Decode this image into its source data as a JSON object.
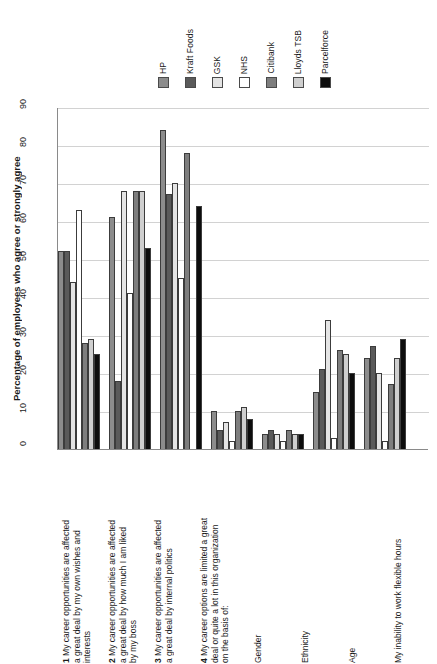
{
  "chart_data": {
    "type": "bar",
    "title": "",
    "subtitle": "",
    "xlabel": "",
    "ylabel": "Percentage of employees who agree or strongly agree",
    "ylim": [
      0,
      90
    ],
    "yticks": [
      0,
      10,
      20,
      30,
      40,
      50,
      60,
      70,
      80,
      90
    ],
    "grid": true,
    "legend_position": "top",
    "orientation": "vertical",
    "categories": [
      "1 My career opportunities are affected a great deal by my own wishes and interests",
      "2 My career opportunities are affected a great deal by how much I am liked by my boss",
      "3 My career opportunities are affected a great deal by internal politics",
      "Gender",
      "Ethnicity",
      "Age",
      "My inability to work flexible hours"
    ],
    "series": [
      {
        "name": "HP",
        "color": "#8c8c8c",
        "values": [
          52,
          61,
          84,
          10,
          4,
          15,
          24
        ]
      },
      {
        "name": "Kraft Foods",
        "color": "#5a5a5a",
        "values": [
          52,
          18,
          67,
          5,
          5,
          21,
          27
        ]
      },
      {
        "name": "GSK",
        "color": "#e4e4e4",
        "values": [
          44,
          68,
          70,
          7,
          4,
          34,
          20
        ]
      },
      {
        "name": "NHS",
        "color": "#ffffff",
        "values": [
          63,
          41,
          45,
          2,
          2,
          3,
          2
        ]
      },
      {
        "name": "Citibank",
        "color": "#7e7e7e",
        "values": [
          28,
          68,
          78,
          10,
          5,
          26,
          17
        ]
      },
      {
        "name": "Lloyds TSB",
        "color": "#cfcfcf",
        "values": [
          29,
          68,
          0,
          11,
          4,
          25,
          24
        ]
      },
      {
        "name": "Parcelforce",
        "color": "#0d0d0d",
        "values": [
          25,
          53,
          64,
          8,
          4,
          20,
          29
        ]
      }
    ],
    "axis_labels_rendered": [
      {
        "number": "1",
        "text": "My career opportunities are affected\na great deal by my own wishes and\ninterests"
      },
      {
        "number": "2",
        "text": "My career opportunities are affected\na great deal by how much I am liked\nby my boss"
      },
      {
        "number": "3",
        "text": "My career opportunities are affected\na great deal by internal politics"
      },
      {
        "number": "4",
        "text": "My career options are limited a great\ndeal or quite a lot in this organization\non the basis of:"
      },
      {
        "number": "",
        "text": "Gender"
      },
      {
        "number": "",
        "text": "Ethnicity"
      },
      {
        "number": "",
        "text": "Age"
      },
      {
        "number": "",
        "text": "My inability to work flexible hours"
      }
    ]
  },
  "legend": {
    "items": [
      {
        "label": "HP",
        "color": "#8c8c8c"
      },
      {
        "label": "Kraft Foods",
        "color": "#5a5a5a"
      },
      {
        "label": "GSK",
        "color": "#e4e4e4"
      },
      {
        "label": "NHS",
        "color": "#ffffff"
      },
      {
        "label": "Citibank",
        "color": "#7e7e7e"
      },
      {
        "label": "Lloyds TSB",
        "color": "#cfcfcf"
      },
      {
        "label": "Parcelforce",
        "color": "#0d0d0d"
      }
    ]
  },
  "axis": {
    "y_title": "Percentage of employees who agree or strongly agree",
    "y_tick_labels": [
      "0",
      "10",
      "20",
      "30",
      "40",
      "50",
      "60",
      "70",
      "80",
      "90"
    ]
  }
}
